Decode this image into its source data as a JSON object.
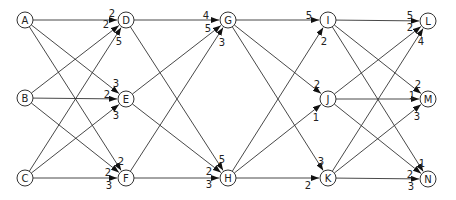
{
  "diagram": {
    "type": "layered-network",
    "nodes": [
      {
        "id": "A",
        "x": 25,
        "y": 20
      },
      {
        "id": "B",
        "x": 25,
        "y": 98
      },
      {
        "id": "C",
        "x": 25,
        "y": 178
      },
      {
        "id": "D",
        "x": 126,
        "y": 20
      },
      {
        "id": "E",
        "x": 126,
        "y": 99
      },
      {
        "id": "F",
        "x": 126,
        "y": 178
      },
      {
        "id": "G",
        "x": 228,
        "y": 20
      },
      {
        "id": "H",
        "x": 228,
        "y": 178
      },
      {
        "id": "I",
        "x": 328,
        "y": 20
      },
      {
        "id": "J",
        "x": 328,
        "y": 99
      },
      {
        "id": "K",
        "x": 328,
        "y": 178
      },
      {
        "id": "L",
        "x": 428,
        "y": 21
      },
      {
        "id": "M",
        "x": 428,
        "y": 99
      },
      {
        "id": "N",
        "x": 428,
        "y": 179
      }
    ],
    "edges": [
      {
        "from": "A",
        "to": "D",
        "weight": "2",
        "lx": 112,
        "ly": 13
      },
      {
        "from": "B",
        "to": "D",
        "weight": "2",
        "lx": 106,
        "ly": 24
      },
      {
        "from": "C",
        "to": "D",
        "weight": "5",
        "lx": 119,
        "ly": 41
      },
      {
        "from": "A",
        "to": "E",
        "weight": "3",
        "lx": 116,
        "ly": 83
      },
      {
        "from": "B",
        "to": "E",
        "weight": "2",
        "lx": 107,
        "ly": 94
      },
      {
        "from": "C",
        "to": "E",
        "weight": "3",
        "lx": 116,
        "ly": 115
      },
      {
        "from": "A",
        "to": "F",
        "weight": "2",
        "lx": 121,
        "ly": 161
      },
      {
        "from": "B",
        "to": "F",
        "weight": "2",
        "lx": 108,
        "ly": 172
      },
      {
        "from": "C",
        "to": "F",
        "weight": "3",
        "lx": 109,
        "ly": 185
      },
      {
        "from": "D",
        "to": "G",
        "weight": "4",
        "lx": 206,
        "ly": 15
      },
      {
        "from": "E",
        "to": "G",
        "weight": "5",
        "lx": 208,
        "ly": 28
      },
      {
        "from": "F",
        "to": "G",
        "weight": "3",
        "lx": 222,
        "ly": 42
      },
      {
        "from": "D",
        "to": "H",
        "weight": "5",
        "lx": 222,
        "ly": 159
      },
      {
        "from": "E",
        "to": "H",
        "weight": "2",
        "lx": 209,
        "ly": 171
      },
      {
        "from": "F",
        "to": "H",
        "weight": "3",
        "lx": 209,
        "ly": 184
      },
      {
        "from": "G",
        "to": "I",
        "weight": "5",
        "lx": 309,
        "ly": 15
      },
      {
        "from": "H",
        "to": "I",
        "weight": "2",
        "lx": 324,
        "ly": 41
      },
      {
        "from": "G",
        "to": "J",
        "weight": "2",
        "lx": 317,
        "ly": 84
      },
      {
        "from": "H",
        "to": "J",
        "weight": "1",
        "lx": 316,
        "ly": 117
      },
      {
        "from": "G",
        "to": "K",
        "weight": "3",
        "lx": 321,
        "ly": 161
      },
      {
        "from": "H",
        "to": "K",
        "weight": "2",
        "lx": 308,
        "ly": 185
      },
      {
        "from": "I",
        "to": "L",
        "weight": "5",
        "lx": 410,
        "ly": 15
      },
      {
        "from": "J",
        "to": "L",
        "weight": "2",
        "lx": 410,
        "ly": 27
      },
      {
        "from": "K",
        "to": "L",
        "weight": "4",
        "lx": 421,
        "ly": 41
      },
      {
        "from": "I",
        "to": "M",
        "weight": "2",
        "lx": 418,
        "ly": 84
      },
      {
        "from": "J",
        "to": "M",
        "weight": "1",
        "lx": 412,
        "ly": 95
      },
      {
        "from": "K",
        "to": "M",
        "weight": "3",
        "lx": 417,
        "ly": 116
      },
      {
        "from": "I",
        "to": "N",
        "weight": "1",
        "lx": 422,
        "ly": 163
      },
      {
        "from": "J",
        "to": "N",
        "weight": "2",
        "lx": 410,
        "ly": 174
      },
      {
        "from": "K",
        "to": "N",
        "weight": "3",
        "lx": 411,
        "ly": 186
      }
    ]
  }
}
